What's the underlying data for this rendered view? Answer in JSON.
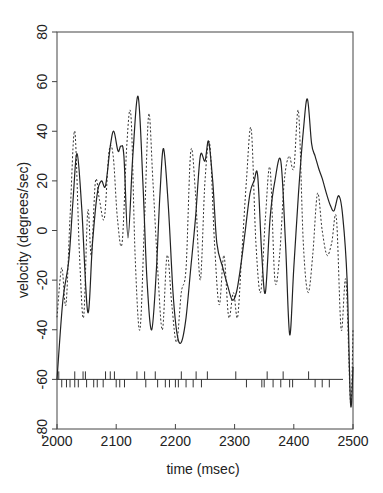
{
  "chart_data": {
    "type": "line",
    "title": "",
    "xlabel": "time (msec)",
    "ylabel": "velocity (degrees/sec)",
    "xlim": [
      2000,
      2500
    ],
    "ylim": [
      -80,
      80
    ],
    "xticks": [
      2000,
      2100,
      2200,
      2300,
      2400,
      2500
    ],
    "yticks": [
      -80,
      -60,
      -40,
      -20,
      0,
      20,
      40,
      60,
      80
    ],
    "grid": false,
    "legend": null,
    "series": [
      {
        "name": "solid",
        "style": "solid",
        "x": [
          2000,
          2010,
          2020,
          2027,
          2034,
          2042,
          2052,
          2060,
          2068,
          2075,
          2082,
          2090,
          2096,
          2103,
          2108,
          2113,
          2120,
          2128,
          2137,
          2145,
          2152,
          2160,
          2168,
          2174,
          2180,
          2188,
          2196,
          2203,
          2210,
          2218,
          2226,
          2234,
          2242,
          2250,
          2256,
          2263,
          2270,
          2280,
          2288,
          2296,
          2303,
          2310,
          2318,
          2326,
          2333,
          2339,
          2346,
          2352,
          2360,
          2368,
          2378,
          2386,
          2393,
          2400,
          2408,
          2416,
          2423,
          2430,
          2436,
          2442,
          2448,
          2455,
          2462,
          2468,
          2476,
          2483,
          2490,
          2496,
          2500
        ],
        "y": [
          -60,
          -28,
          -12,
          12,
          31,
          8,
          -33,
          -5,
          15,
          20,
          18,
          34,
          40,
          32,
          34,
          30,
          -3,
          30,
          54,
          20,
          -20,
          -40,
          -15,
          15,
          33,
          10,
          -25,
          -42,
          -45,
          -35,
          -15,
          5,
          30,
          28,
          36,
          20,
          -5,
          -15,
          -22,
          -28,
          -25,
          -15,
          0,
          15,
          20,
          22,
          -10,
          -25,
          5,
          20,
          28,
          -5,
          -42,
          -15,
          15,
          40,
          53,
          35,
          30,
          25,
          21,
          15,
          10,
          8,
          14,
          5,
          -20,
          -70,
          -55
        ]
      },
      {
        "name": "dotted",
        "style": "dotted",
        "x": [
          2000,
          2008,
          2015,
          2022,
          2030,
          2038,
          2045,
          2052,
          2058,
          2065,
          2072,
          2080,
          2088,
          2095,
          2102,
          2110,
          2118,
          2125,
          2132,
          2140,
          2148,
          2155,
          2162,
          2170,
          2178,
          2186,
          2194,
          2202,
          2210,
          2218,
          2226,
          2234,
          2242,
          2250,
          2258,
          2266,
          2274,
          2282,
          2290,
          2298,
          2305,
          2312,
          2320,
          2328,
          2336,
          2344,
          2352,
          2360,
          2368,
          2376,
          2384,
          2392,
          2400,
          2408,
          2416,
          2424,
          2432,
          2440,
          2448,
          2456,
          2464,
          2472,
          2480,
          2488,
          2496,
          2500
        ],
        "y": [
          -35,
          -15,
          -30,
          5,
          40,
          -10,
          -35,
          8,
          -10,
          20,
          12,
          5,
          32,
          30,
          5,
          -5,
          35,
          46,
          -10,
          -40,
          5,
          47,
          20,
          -15,
          -40,
          -10,
          -30,
          -45,
          -25,
          -15,
          32,
          15,
          -20,
          20,
          35,
          -5,
          -30,
          -10,
          -35,
          -25,
          -35,
          -10,
          20,
          41,
          -5,
          -25,
          5,
          25,
          -20,
          -10,
          20,
          30,
          25,
          48,
          -5,
          -25,
          -10,
          15,
          0,
          -10,
          -5,
          5,
          -40,
          -20,
          -70,
          -40
        ]
      }
    ],
    "rug": {
      "baseline": -60,
      "up_ticks": [
        2003,
        2030,
        2044,
        2048,
        2082,
        2090,
        2097,
        2135,
        2148,
        2166,
        2210,
        2235,
        2254,
        2302,
        2355,
        2382,
        2425
      ],
      "down_ticks": [
        2008,
        2016,
        2022,
        2030,
        2036,
        2050,
        2062,
        2068,
        2078,
        2100,
        2106,
        2114,
        2150,
        2170,
        2183,
        2190,
        2200,
        2205,
        2218,
        2230,
        2244,
        2320,
        2346,
        2350,
        2365,
        2378,
        2393,
        2398,
        2436,
        2448,
        2460
      ]
    }
  }
}
